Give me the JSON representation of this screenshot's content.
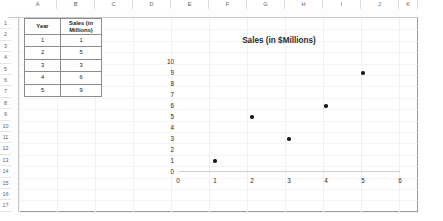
{
  "app": {
    "type": "spreadsheet-worksheet"
  },
  "grid": {
    "column_headers": [
      "A",
      "B",
      "C",
      "D",
      "E",
      "F",
      "G",
      "H",
      "I",
      "J",
      "K"
    ],
    "row_headers": [
      "1",
      "2",
      "3",
      "4",
      "5",
      "6",
      "7",
      "8",
      "9",
      "10",
      "11",
      "12",
      "13",
      "14",
      "15",
      "16",
      "17"
    ]
  },
  "table": {
    "headers": {
      "year": "Year",
      "sales_line1": "Sales (in",
      "sales_line2": "Millions)"
    },
    "rows": [
      {
        "year": "1",
        "sales": "1"
      },
      {
        "year": "2",
        "sales": "5"
      },
      {
        "year": "3",
        "sales": "3"
      },
      {
        "year": "4",
        "sales": "6"
      },
      {
        "year": "5",
        "sales": "9"
      }
    ]
  },
  "chart_data": {
    "type": "scatter",
    "title": "Sales (in $Millions)",
    "xlabel": "",
    "ylabel": "",
    "x": [
      1,
      2,
      3,
      4,
      5
    ],
    "values": [
      1,
      5,
      3,
      6,
      9
    ],
    "xlim": [
      0,
      6
    ],
    "ylim": [
      0,
      10
    ],
    "xticks": [
      "0",
      "1",
      "2",
      "3",
      "4",
      "5",
      "6"
    ],
    "yticks": [
      "0",
      "1",
      "2",
      "3",
      "4",
      "5",
      "6",
      "7",
      "8",
      "9",
      "10"
    ],
    "grid": false,
    "legend": false,
    "marker_color": "#1a1a1a"
  }
}
